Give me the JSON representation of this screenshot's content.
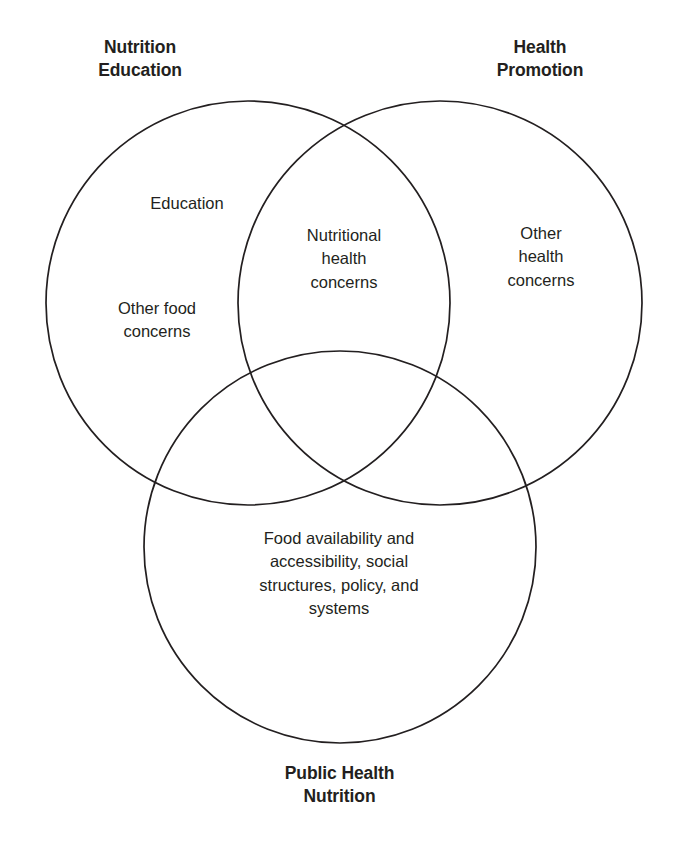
{
  "diagram": {
    "type": "venn-3-circle",
    "background_color": "#ffffff",
    "stroke_color": "#231f20",
    "text_color": "#231f20",
    "outer_labels": [
      {
        "id": "nutrition-education",
        "text": "Nutrition\nEducation"
      },
      {
        "id": "health-promotion",
        "text": "Health\nPromotion"
      },
      {
        "id": "public-health-nutrition",
        "text": "Public Health\nNutrition"
      }
    ],
    "regions": [
      {
        "id": "education",
        "text": "Education"
      },
      {
        "id": "other-food-concerns",
        "text": "Other food\nconcerns"
      },
      {
        "id": "nutritional-health-concerns",
        "text": "Nutritional\nhealth\nconcerns"
      },
      {
        "id": "other-health-concerns",
        "text": "Other\nhealth\nconcerns"
      },
      {
        "id": "food-availability",
        "text": "Food availability and\naccessibility, social\nstructures, policy, and\nsystems"
      }
    ]
  }
}
